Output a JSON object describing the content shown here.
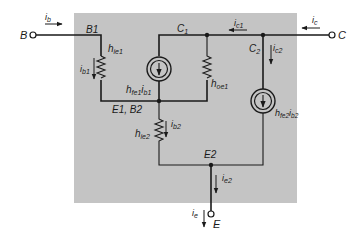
{
  "diagram": {
    "type": "circuit",
    "background_box_color": "#c4c4c4",
    "line_color": "#1a1a1a",
    "terminals": {
      "B": "B",
      "C": "C",
      "E": "E"
    },
    "nodes": {
      "B1": "B1",
      "C1": "C",
      "C1_sub": "1",
      "C2": "C",
      "C2_sub": "2",
      "E1B2": "E1, B2",
      "E2": "E2"
    },
    "components": {
      "hie1": {
        "main": "h",
        "sub": "ie1"
      },
      "hfe1ib1": {
        "main": "h",
        "sub": "fe1",
        "main2": "i",
        "sub2": "b1"
      },
      "hoe1": {
        "main": "h",
        "sub": "oe1"
      },
      "hie2": {
        "main": "h",
        "sub": "ie2"
      },
      "hfe2ib2": {
        "main": "h",
        "sub": "fe2",
        "main2": "i",
        "sub2": "b2"
      }
    },
    "currents": {
      "ib": {
        "main": "i",
        "sub": "b"
      },
      "ib1": {
        "main": "i",
        "sub": "b1"
      },
      "ic1": {
        "main": "i",
        "sub": "c1"
      },
      "ic": {
        "main": "i",
        "sub": "c"
      },
      "ic2": {
        "main": "i",
        "sub": "c2"
      },
      "ib2": {
        "main": "i",
        "sub": "b2"
      },
      "ie2": {
        "main": "i",
        "sub": "e2"
      },
      "ie": {
        "main": "i",
        "sub": "e"
      }
    }
  }
}
